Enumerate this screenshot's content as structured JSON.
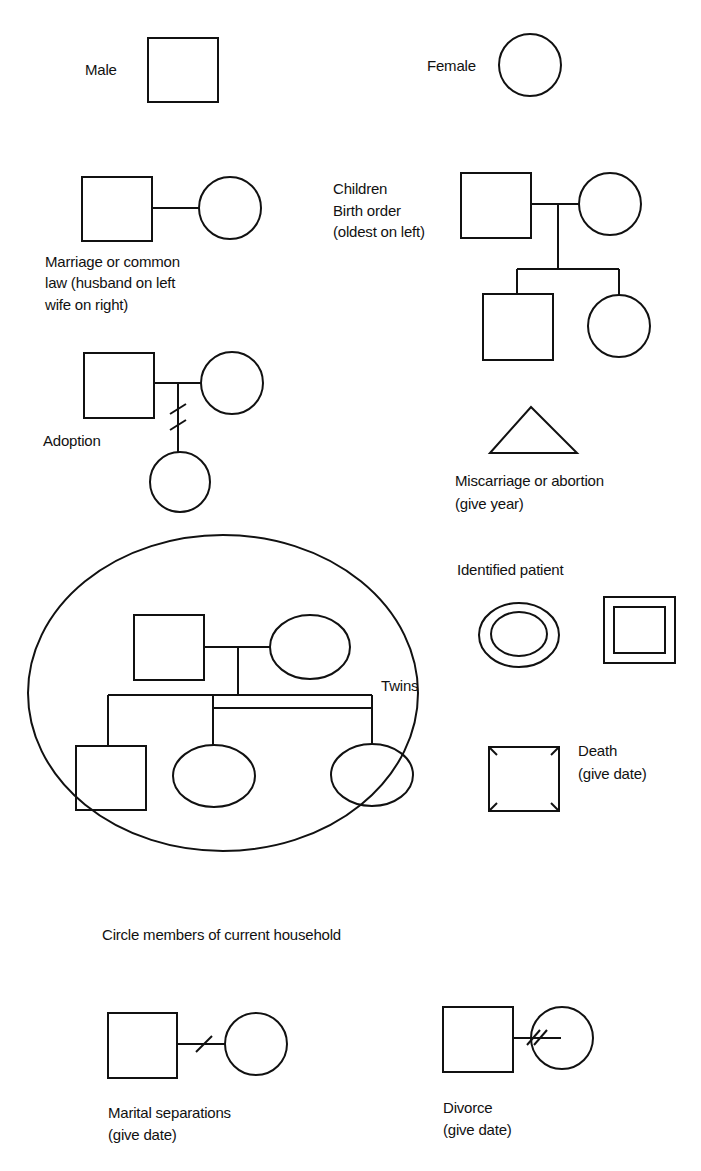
{
  "diagram": {
    "type": "genogram-legend",
    "labels": {
      "male": "Male",
      "female": "Female",
      "marriage_1": "Marriage or common",
      "marriage_2": "law (husband on left",
      "marriage_3": "wife on right)",
      "children_1": "Children",
      "children_2": "Birth order",
      "children_3": "(oldest on left)",
      "adoption": "Adoption",
      "miscarriage_1": "Miscarriage or abortion",
      "miscarriage_2": "(give year)",
      "identified_patient": "Identified patient",
      "twins": "Twins",
      "death_1": "Death",
      "death_2": "(give date)",
      "household": "Circle members of current household",
      "separation_1": "Marital separations",
      "separation_2": "(give date)",
      "divorce_1": "Divorce",
      "divorce_2": "(give date)"
    },
    "symbols": [
      {
        "name": "male",
        "shape": "square"
      },
      {
        "name": "female",
        "shape": "circle"
      },
      {
        "name": "marriage",
        "shape": "square-line-circle"
      },
      {
        "name": "children",
        "shape": "parents-with-two-children"
      },
      {
        "name": "adoption",
        "shape": "parents-with-double-slash-child"
      },
      {
        "name": "miscarriage",
        "shape": "triangle"
      },
      {
        "name": "identified-patient",
        "shape": "double-ellipse / double-square"
      },
      {
        "name": "twins",
        "shape": "bar-joined-siblings"
      },
      {
        "name": "death",
        "shape": "square-with-corner-ticks"
      },
      {
        "name": "household",
        "shape": "large-enclosing-ellipse"
      },
      {
        "name": "separation",
        "shape": "line-single-slash"
      },
      {
        "name": "divorce",
        "shape": "line-double-slash"
      }
    ],
    "stroke_color": "#111111",
    "background": "#ffffff"
  }
}
